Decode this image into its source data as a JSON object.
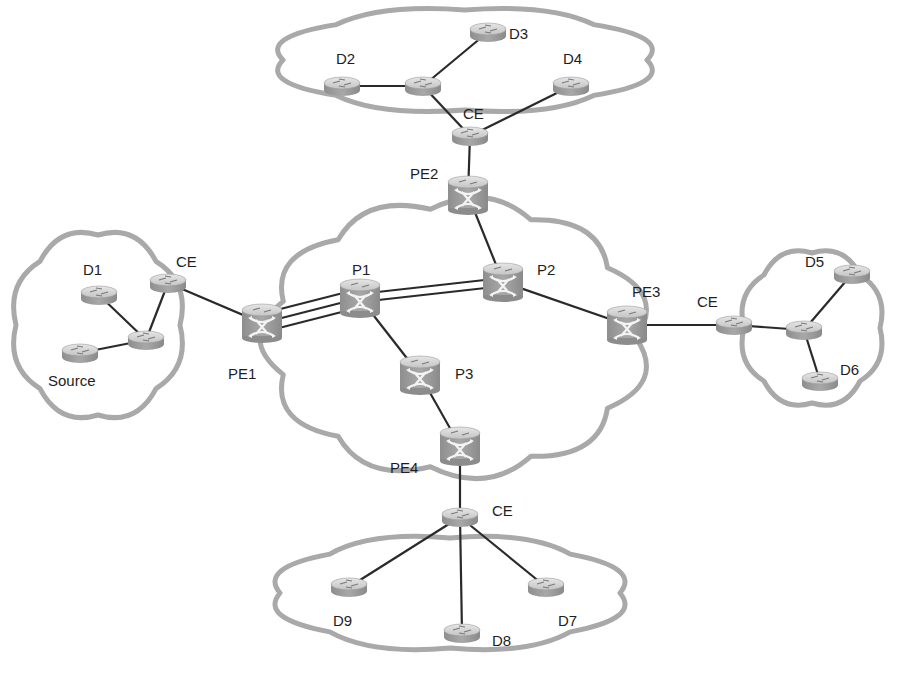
{
  "diagram": {
    "type": "network-topology",
    "colors": {
      "cloud_stroke": "#a9a9a9",
      "link": "#2a2a2a",
      "router_body": "#9a9a9a",
      "router_top": "#d6d6d6",
      "label": "#1e1e1e"
    },
    "clouds": [
      {
        "id": "core",
        "name": "core-network-cloud",
        "cx": 456,
        "cy": 338,
        "rx": 180,
        "ry": 130
      },
      {
        "id": "top",
        "name": "site-cloud-top",
        "cx": 465,
        "cy": 60,
        "rx": 182,
        "ry": 50
      },
      {
        "id": "left",
        "name": "site-cloud-left",
        "cx": 98,
        "cy": 325,
        "rx": 82,
        "ry": 90
      },
      {
        "id": "right",
        "name": "site-cloud-right",
        "cx": 812,
        "cy": 328,
        "rx": 68,
        "ry": 75
      },
      {
        "id": "bottom",
        "name": "site-cloud-bottom",
        "cx": 450,
        "cy": 593,
        "rx": 170,
        "ry": 55
      }
    ],
    "nodes": [
      {
        "id": "P1",
        "label": "P1",
        "type": "switch-router",
        "x": 360,
        "y": 298,
        "lx": 352,
        "ly": 262
      },
      {
        "id": "P2",
        "label": "P2",
        "type": "switch-router",
        "x": 503,
        "y": 282,
        "lx": 537,
        "ly": 262
      },
      {
        "id": "P3",
        "label": "P3",
        "type": "switch-router",
        "x": 420,
        "y": 375,
        "lx": 455,
        "ly": 366
      },
      {
        "id": "PE1",
        "label": "PE1",
        "type": "switch-router",
        "x": 262,
        "y": 323,
        "lx": 228,
        "ly": 366
      },
      {
        "id": "PE2",
        "label": "PE2",
        "type": "switch-router",
        "x": 468,
        "y": 195,
        "lx": 410,
        "ly": 166
      },
      {
        "id": "PE3",
        "label": "PE3",
        "type": "switch-router",
        "x": 627,
        "y": 325,
        "lx": 632,
        "ly": 284
      },
      {
        "id": "PE4",
        "label": "PE4",
        "type": "switch-router",
        "x": 460,
        "y": 446,
        "lx": 390,
        "ly": 460
      },
      {
        "id": "CE_top",
        "label": "CE",
        "type": "router",
        "x": 470,
        "y": 136,
        "lx": 463,
        "ly": 106
      },
      {
        "id": "CE_left",
        "label": "CE",
        "type": "router",
        "x": 168,
        "y": 283,
        "lx": 176,
        "ly": 254
      },
      {
        "id": "CE_right",
        "label": "CE",
        "type": "router",
        "x": 734,
        "y": 325,
        "lx": 697,
        "ly": 294
      },
      {
        "id": "CE_bottom",
        "label": "CE",
        "type": "router",
        "x": 460,
        "y": 517,
        "lx": 492,
        "ly": 503
      },
      {
        "id": "R_top",
        "label": "",
        "type": "router",
        "x": 423,
        "y": 86,
        "lx": 0,
        "ly": 0
      },
      {
        "id": "R_left",
        "label": "",
        "type": "router",
        "x": 146,
        "y": 340,
        "lx": 0,
        "ly": 0
      },
      {
        "id": "R_right",
        "label": "",
        "type": "router",
        "x": 804,
        "y": 330,
        "lx": 0,
        "ly": 0
      },
      {
        "id": "D1",
        "label": "D1",
        "type": "router",
        "x": 99,
        "y": 295,
        "lx": 83,
        "ly": 262
      },
      {
        "id": "Source",
        "label": "Source",
        "type": "router",
        "x": 80,
        "y": 353,
        "lx": 48,
        "ly": 373
      },
      {
        "id": "D2",
        "label": "D2",
        "type": "router",
        "x": 342,
        "y": 86,
        "lx": 336,
        "ly": 51
      },
      {
        "id": "D3",
        "label": "D3",
        "type": "router",
        "x": 488,
        "y": 32,
        "lx": 509,
        "ly": 26
      },
      {
        "id": "D4",
        "label": "D4",
        "type": "router",
        "x": 571,
        "y": 86,
        "lx": 563,
        "ly": 51
      },
      {
        "id": "D5",
        "label": "D5",
        "type": "router",
        "x": 852,
        "y": 274,
        "lx": 805,
        "ly": 254
      },
      {
        "id": "D6",
        "label": "D6",
        "type": "router",
        "x": 820,
        "y": 381,
        "lx": 840,
        "ly": 362
      },
      {
        "id": "D7",
        "label": "D7",
        "type": "router",
        "x": 546,
        "y": 587,
        "lx": 558,
        "ly": 613
      },
      {
        "id": "D8",
        "label": "D8",
        "type": "router",
        "x": 462,
        "y": 633,
        "lx": 492,
        "ly": 633
      },
      {
        "id": "D9",
        "label": "D9",
        "type": "router",
        "x": 349,
        "y": 587,
        "lx": 333,
        "ly": 613
      }
    ],
    "links": [
      {
        "from": "R_top",
        "to": "D2"
      },
      {
        "from": "R_top",
        "to": "D3"
      },
      {
        "from": "R_top",
        "to": "CE_top"
      },
      {
        "from": "CE_top",
        "to": "D4"
      },
      {
        "from": "CE_top",
        "to": "PE2"
      },
      {
        "from": "PE2",
        "to": "P2"
      },
      {
        "from": "P2",
        "to": "PE3"
      },
      {
        "from": "PE3",
        "to": "CE_right"
      },
      {
        "from": "CE_right",
        "to": "R_right"
      },
      {
        "from": "R_right",
        "to": "D5"
      },
      {
        "from": "R_right",
        "to": "D6"
      },
      {
        "from": "P1",
        "to": "P3"
      },
      {
        "from": "P3",
        "to": "PE4"
      },
      {
        "from": "PE4",
        "to": "CE_bottom"
      },
      {
        "from": "CE_bottom",
        "to": "D9"
      },
      {
        "from": "CE_bottom",
        "to": "D8"
      },
      {
        "from": "CE_bottom",
        "to": "D7"
      },
      {
        "from": "PE1",
        "to": "CE_left"
      },
      {
        "from": "CE_left",
        "to": "R_left"
      },
      {
        "from": "R_left",
        "to": "D1"
      },
      {
        "from": "R_left",
        "to": "Source"
      }
    ],
    "parallel_links": [
      {
        "from": "P1",
        "to": "P2",
        "count": 2,
        "spacing": 8
      },
      {
        "from": "PE1",
        "to": "P1",
        "count": 3,
        "spacing": 9
      }
    ]
  }
}
